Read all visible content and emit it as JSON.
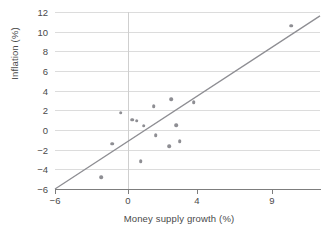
{
  "chart_data": {
    "type": "scatter",
    "title": "",
    "xlabel": "Money supply growth (%)",
    "ylabel": "Inflation (%)",
    "xlim": [
      -6,
      11.5
    ],
    "ylim": [
      -6,
      12
    ],
    "xticks": [
      -6,
      0,
      4,
      9
    ],
    "xtick_labels": [
      "−6",
      "0",
      "4",
      "9"
    ],
    "yticks": [
      -6,
      -4,
      -2,
      0,
      2,
      4,
      6,
      8,
      10,
      12
    ],
    "ytick_labels": [
      "−6",
      "−4",
      "−2",
      "0",
      "2",
      "4",
      "6",
      "8",
      "10",
      "12"
    ],
    "grid": "horizontal",
    "legend": "none",
    "point_color": "#8e8e93",
    "line_color": "#8e8e93",
    "gridline_color": "#dcdcdc",
    "axis_color": "#7d7d7d",
    "points": [
      {
        "x": -2.2,
        "y": -4.8
      },
      {
        "x": -1.3,
        "y": -1.4
      },
      {
        "x": -0.6,
        "y": 1.75
      },
      {
        "x": 0.25,
        "y": 1.05
      },
      {
        "x": 0.5,
        "y": 0.95
      },
      {
        "x": 0.75,
        "y": -3.15
      },
      {
        "x": 0.9,
        "y": 0.45
      },
      {
        "x": 1.5,
        "y": 2.4
      },
      {
        "x": 1.6,
        "y": -0.55
      },
      {
        "x": 2.4,
        "y": -1.65
      },
      {
        "x": 2.5,
        "y": 3.15
      },
      {
        "x": 2.8,
        "y": 0.5
      },
      {
        "x": 3.0,
        "y": -1.15
      },
      {
        "x": 3.8,
        "y": 2.85
      },
      {
        "x": 10.0,
        "y": 10.6
      }
    ],
    "trend_line": {
      "description": "45-degree reference line through the origin",
      "x_start": -6,
      "y_start": -6,
      "x_end": 11.5,
      "y_end": 11.6
    }
  }
}
